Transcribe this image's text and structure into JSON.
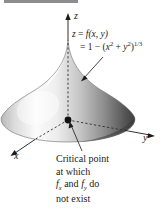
{
  "figure": {
    "caption_band_label": "FIGURE 13.66",
    "background_color": "#ffffff",
    "band_color": "#8d8d8d",
    "ink_color": "#1a1a1a"
  },
  "axes": {
    "z_label": "z",
    "y_label": "y",
    "x_label": "x"
  },
  "equation": {
    "line1_lhs": "z",
    "line1_eq": " = ",
    "line1_fn": "f",
    "line1_args": "(x, y)",
    "line2_eq": "= 1 − (",
    "line2_x": "x",
    "line2_xexp": "2",
    "line2_plus": " + ",
    "line2_y": "y",
    "line2_yexp": "2",
    "line2_close": ")",
    "line2_power": "1/3"
  },
  "annotation": {
    "line1": "Critical point",
    "line2": "at which",
    "line3_f1": "f",
    "line3_sub1": "x",
    "line3_mid": " and ",
    "line3_f2": "f",
    "line3_sub2": "y",
    "line3_end": " do",
    "line4": "not exist"
  },
  "surface": {
    "description": "cusp-peaked surface of revolution",
    "highlight_color": "#fcfcfc",
    "midtone_color": "#c9c9c9",
    "shadow_color": "#4a4a4a",
    "edge_color": "#6b6b6b",
    "apex_x": 68,
    "apex_y": 40,
    "origin_x": 68,
    "origin_y": 120,
    "base_rx": 67,
    "base_ry": 22
  },
  "markers": {
    "critical_point_label": "critical-point-dot"
  }
}
